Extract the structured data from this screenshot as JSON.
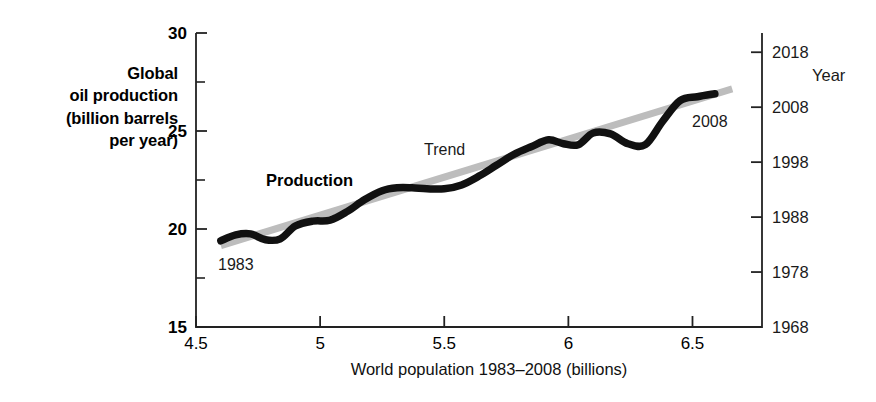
{
  "figure": {
    "left_axis_title_lines": [
      "Global",
      "oil production",
      "(billion barrels",
      "per year)"
    ],
    "right_axis_title": "Year",
    "x_axis_title": "World population 1983–2008 (billions)",
    "colors": {
      "production_line": "#111111",
      "trend_line": "#bdbdbd",
      "axis": "#222222",
      "text": "#111111"
    }
  },
  "annotations": {
    "production": "Production",
    "trend": "Trend",
    "start_year": "1983",
    "end_year": "2008"
  },
  "chart_data": {
    "type": "line",
    "title": "",
    "subtitle": "",
    "xlabel": "World population 1983–2008 (billions)",
    "ylabel": "Global oil production (billion barrels per year)",
    "y2label": "Year",
    "xlim": [
      4.5,
      6.78
    ],
    "ylim": [
      15,
      30
    ],
    "y2lim": [
      1968,
      2021.5
    ],
    "grid": false,
    "legend_position": "inline-annotations",
    "x_ticks": [
      "4.5",
      "5",
      "5.5",
      "6",
      "6.5"
    ],
    "x_tick_values": [
      4.5,
      5,
      5.5,
      6,
      6.5
    ],
    "y_ticks": [
      "15",
      "20",
      "25",
      "30"
    ],
    "y_tick_values": [
      15,
      20,
      25,
      30
    ],
    "y_minor_tick_values": [
      17.5,
      22.5,
      27.5
    ],
    "y2_ticks": [
      "1968",
      "1978",
      "1988",
      "1998",
      "2008",
      "2018"
    ],
    "y2_tick_values": [
      1968,
      1978,
      1988,
      1998,
      2008,
      2018
    ],
    "series": [
      {
        "name": "Production",
        "color": "#111111",
        "x": [
          4.6,
          4.66,
          4.72,
          4.78,
          4.84,
          4.9,
          4.97,
          5.04,
          5.11,
          5.18,
          5.25,
          5.31,
          5.37,
          5.43,
          5.5,
          5.57,
          5.64,
          5.71,
          5.78,
          5.85,
          5.92,
          5.98,
          6.04,
          6.1,
          6.17,
          6.24,
          6.31,
          6.38,
          6.45,
          6.52,
          6.59
        ],
        "y": [
          19.4,
          19.7,
          19.75,
          19.45,
          19.5,
          20.15,
          20.4,
          20.45,
          20.9,
          21.5,
          21.95,
          22.1,
          22.1,
          22.05,
          22.05,
          22.25,
          22.7,
          23.25,
          23.8,
          24.2,
          24.55,
          24.35,
          24.3,
          24.9,
          24.85,
          24.35,
          24.3,
          25.5,
          26.55,
          26.75,
          26.9
        ],
        "start_label": "1983",
        "end_label": "2008"
      },
      {
        "name": "Trend",
        "color": "#bdbdbd",
        "x": [
          4.6,
          6.66
        ],
        "y": [
          19.15,
          27.15
        ]
      }
    ]
  }
}
